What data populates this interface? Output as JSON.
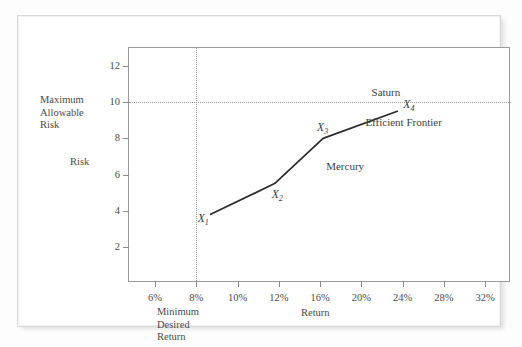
{
  "figure": {
    "background": "#ffffff",
    "frame_color": "#d8d8d8",
    "axis_color": "#9a9a9a",
    "line_color": "#2b2b2b",
    "guide_color": "#9d9d9d"
  },
  "labels": {
    "max_allowable_risk": "Maximum\nAllowable\nRisk",
    "min_desired_return": "Minimum\nDesired\nReturn",
    "risk_axis_title": "Risk",
    "return_axis_title": "Return"
  },
  "chart_data": {
    "type": "line",
    "title": "",
    "xlabel": "Return",
    "ylabel": "Risk",
    "xlim": [
      4,
      34
    ],
    "ylim": [
      0,
      13
    ],
    "grid": false,
    "legend": "none",
    "xticklabels": [
      "6%",
      "8%",
      "10%",
      "12%",
      "16%",
      "20%",
      "24%",
      "28%",
      "32%"
    ],
    "xtickvalues": [
      6,
      8,
      10,
      12,
      16,
      20,
      24,
      28,
      32
    ],
    "yticklabels": [
      "2",
      "4",
      "6",
      "8",
      "10",
      "12"
    ],
    "ytickvalues": [
      2,
      4,
      6,
      8,
      10,
      12
    ],
    "series": [
      {
        "name": "Efficient Frontier",
        "points": [
          {
            "label": "X1",
            "x": 8.7,
            "y": 3.8
          },
          {
            "label": "X2",
            "x": 11.8,
            "y": 5.5
          },
          {
            "label": "X3",
            "x": 16.3,
            "y": 8.0
          },
          {
            "label": "X4",
            "x": 23.5,
            "y": 9.5
          }
        ]
      }
    ],
    "point_labels": [
      {
        "text": "X",
        "sub": "1"
      },
      {
        "text": "X",
        "sub": "2"
      },
      {
        "text": "X",
        "sub": "3"
      },
      {
        "text": "X",
        "sub": "4"
      }
    ],
    "annotations": [
      {
        "name": "saturn",
        "text": "Saturn"
      },
      {
        "name": "efficient-frontier",
        "text": "Efficient Frontier"
      },
      {
        "name": "mercury",
        "text": "Mercury"
      }
    ],
    "reference_lines": [
      {
        "name": "maximum-allowable-risk",
        "orientation": "horizontal",
        "value": 10,
        "style": "dotted"
      },
      {
        "name": "minimum-desired-return",
        "orientation": "vertical",
        "value": 8,
        "style": "dotted"
      }
    ]
  }
}
